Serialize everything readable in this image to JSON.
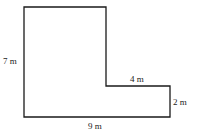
{
  "diagram": {
    "type": "L-shaped floor plan",
    "labels": {
      "left_height": "7 m",
      "inner_top_width": "4 m",
      "right_height": "2 m",
      "bottom_width": "9 m"
    },
    "colors": {
      "stroke": "#1a1a1a",
      "background": "#ffffff"
    }
  }
}
